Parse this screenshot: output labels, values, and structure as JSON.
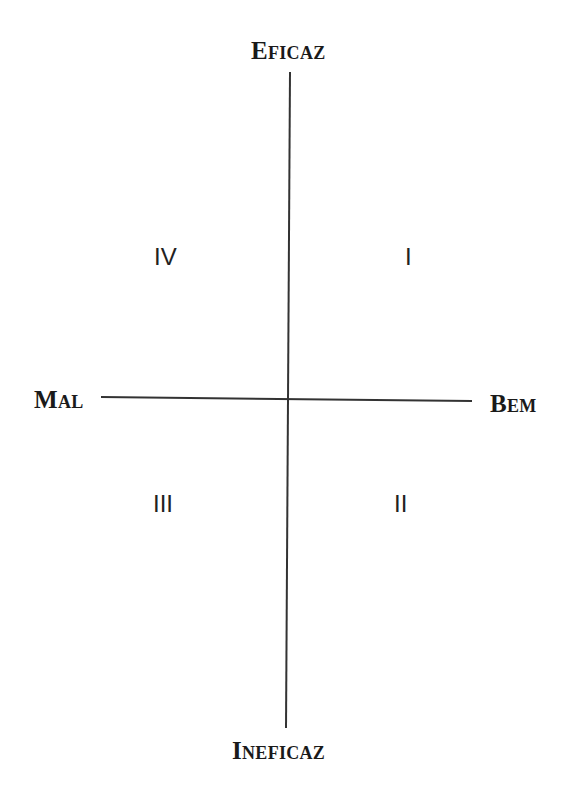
{
  "diagram": {
    "type": "quadrant",
    "axes": {
      "vertical": {
        "top": {
          "first": "E",
          "rest": "FICAZ",
          "full": "Eficaz"
        },
        "bottom": {
          "first": "I",
          "rest": "NEFICAZ",
          "full": "Ineficaz"
        }
      },
      "horizontal": {
        "left": {
          "first": "M",
          "rest": "AL",
          "full": "Mal"
        },
        "right": {
          "first": "B",
          "rest": "EM",
          "full": "Bem"
        }
      }
    },
    "quadrants": {
      "top_right": "I",
      "bottom_right": "II",
      "bottom_left": "III",
      "top_left": "IV"
    },
    "colors": {
      "line": "#333333",
      "text": "#1a1a1a",
      "background": "#ffffff"
    }
  }
}
